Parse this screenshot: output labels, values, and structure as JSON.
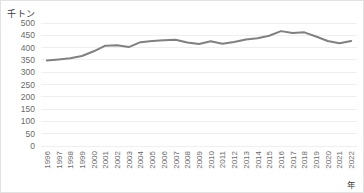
{
  "chart_data": {
    "type": "line",
    "title": "",
    "xlabel": "年",
    "ylabel": "千トン",
    "ylim": [
      0,
      500
    ],
    "yticks": [
      0,
      50,
      100,
      150,
      200,
      250,
      300,
      350,
      400,
      450,
      500
    ],
    "grid": true,
    "legend": false,
    "line_color": "#808080",
    "categories": [
      "1996",
      "1997",
      "1998",
      "1999",
      "2000",
      "2001",
      "2002",
      "2003",
      "2004",
      "2005",
      "2006",
      "2007",
      "2008",
      "2009",
      "2010",
      "2011",
      "2012",
      "2013",
      "2014",
      "2015",
      "2016",
      "2017",
      "2018",
      "2019",
      "2020",
      "2021",
      "2022"
    ],
    "values": [
      348,
      352,
      357,
      366,
      385,
      408,
      410,
      402,
      422,
      427,
      430,
      432,
      421,
      415,
      426,
      416,
      423,
      433,
      438,
      448,
      467,
      459,
      462,
      445,
      427,
      418,
      427
    ]
  },
  "axis": {
    "y_unit": "千トン",
    "x_title": "年"
  }
}
